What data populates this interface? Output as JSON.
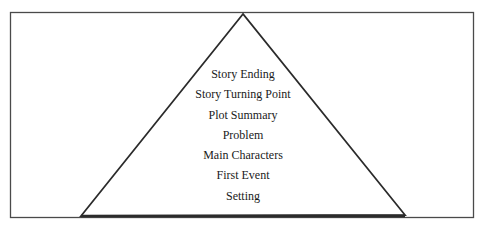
{
  "diagram": {
    "type": "pyramid",
    "colors": {
      "stroke": "#2b2b2b",
      "frame": "#4a4a4a",
      "text": "#1a1a1a",
      "background": "#ffffff"
    },
    "levels": [
      "Story Ending",
      "Story Turning Point",
      "Plot Summary",
      "Problem",
      "Main Characters",
      "First Event",
      "Setting"
    ]
  }
}
